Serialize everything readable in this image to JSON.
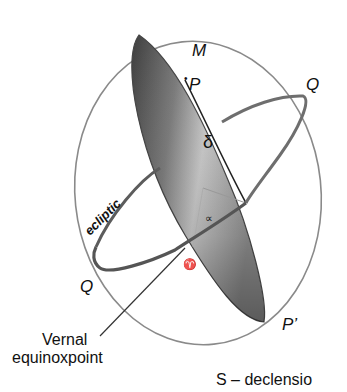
{
  "diagram": {
    "labels": {
      "M": "M",
      "P": "P",
      "Q_top": "Q",
      "Q_bottom": "Q",
      "P_prime": "P’",
      "delta": "δ",
      "alpha": "∝",
      "aries": "♈",
      "equator_script": "ecliptic",
      "vernal_line1": "Vernal",
      "vernal_line2": "equinoxpoint",
      "caption": "S – declensio"
    },
    "colors": {
      "celestial_sphere": "#8a8a8a",
      "equator_ring": "#6e6e6e",
      "meridian_fill_dark": "#5a5a5a",
      "meridian_fill_light": "#bdbdbd",
      "text": "#111111"
    }
  }
}
